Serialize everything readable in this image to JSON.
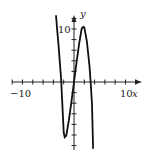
{
  "chart_data": {
    "type": "line",
    "title": "",
    "xlabel": "x",
    "ylabel": "y",
    "xlim": [
      -10,
      12
    ],
    "ylim": [
      -12,
      12
    ],
    "x_tick_labels": [
      "-10",
      "10"
    ],
    "y_tick_labels": [
      "10"
    ],
    "x_tick_step": 2,
    "y_tick_step": 2,
    "grid": false,
    "series": [
      {
        "name": "f(x)",
        "x": [
          -3.5,
          -3.3,
          -3,
          -2.5,
          -2,
          -1.8,
          -1.5,
          -1,
          -0.5,
          0,
          0.5,
          1,
          1.5,
          1.8,
          2,
          2.5,
          3,
          3.3,
          3.5,
          3.7
        ],
        "y": [
          12.6,
          10.2,
          7.0,
          0.6,
          -9.5,
          -10.4,
          -10.1,
          -7.3,
          -3.8,
          0,
          3.8,
          7.3,
          10.1,
          10.4,
          10.3,
          7.6,
          3.0,
          -1.1,
          -4.2,
          -12.6
        ]
      }
    ]
  },
  "labels": {
    "x_axis": "x",
    "y_axis": "y",
    "x_neg": "−10",
    "x_pos": "10",
    "y_pos": "10"
  }
}
